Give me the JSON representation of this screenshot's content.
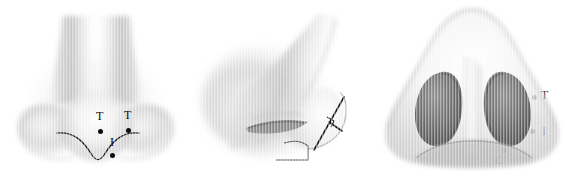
{
  "figure": {
    "caption": "",
    "background_color": "#ffffff",
    "ink_color": "#0d0d0d",
    "panel_count": 3
  },
  "panels": [
    {
      "id": "panel-frontal",
      "view_name": "frontal-inferior-view",
      "annotations": [
        {
          "label": "T",
          "x": 100,
          "y": 131,
          "label_x": 96,
          "label_y": 116
        },
        {
          "label": "T",
          "x": 128,
          "y": 130,
          "label_x": 124,
          "label_y": 115
        },
        {
          "label": "I",
          "x": 112,
          "y": 155,
          "label_x": 109,
          "label_y": 140
        }
      ]
    },
    {
      "id": "panel-lateral",
      "view_name": "lateral-view",
      "annotations": [
        {
          "label": "T",
          "x": 344,
          "y": 97,
          "label_x": 350,
          "label_y": 90
        },
        {
          "label": "I",
          "x": 342,
          "y": 131,
          "label_x": 350,
          "label_y": 127
        },
        {
          "label": "C'",
          "x": 314,
          "y": 150,
          "label_x": 307,
          "label_y": 156
        }
      ]
    },
    {
      "id": "panel-basal",
      "view_name": "basal-view",
      "annotations": [
        {
          "label": "T",
          "x": 468,
          "y": 23,
          "label_x": 474,
          "label_y": 15
        },
        {
          "label": "I",
          "x": 466,
          "y": 55,
          "label_x": 473,
          "label_y": 48
        },
        {
          "label": "C'",
          "x": 466,
          "y": 80,
          "label_x": 473,
          "label_y": 72
        }
      ]
    }
  ],
  "legend": {
    "T": "T",
    "I": "I",
    "C_prime": "C'"
  }
}
